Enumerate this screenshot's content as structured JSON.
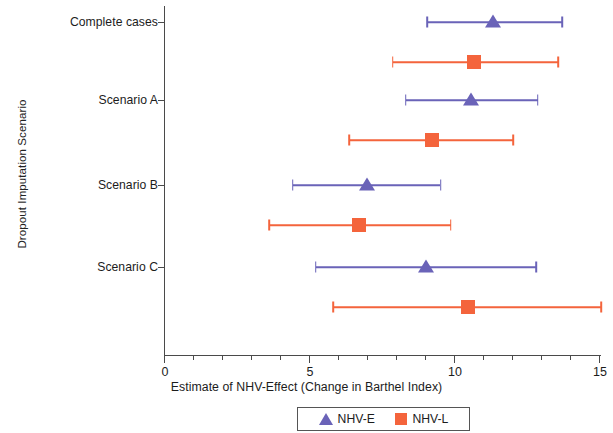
{
  "chart_data": {
    "type": "scatter",
    "title": "",
    "xlabel": "Estimate of NHV-Effect (Change in Barthel Index)",
    "ylabel": "Dropout Imputation Scenario",
    "xlim": [
      0,
      15
    ],
    "xticks": [
      0,
      5,
      10,
      15
    ],
    "xtick_labels": [
      "0",
      "5",
      "10",
      "15"
    ],
    "minor_xticks": [
      1,
      2,
      3,
      4,
      6,
      7,
      8,
      9,
      11,
      12,
      13,
      14
    ],
    "grid": false,
    "legend_position": "bottom",
    "categories": [
      "Complete cases",
      "Scenario A",
      "Scenario B",
      "Scenario C"
    ],
    "series": [
      {
        "name": "NHV-E",
        "color": "#6A63B8",
        "marker": "triangle",
        "values": [
          11.3,
          10.55,
          6.95,
          9.0
        ],
        "ci_low": [
          9.05,
          8.3,
          4.4,
          5.2
        ],
        "ci_high": [
          13.7,
          12.85,
          9.5,
          12.8
        ]
      },
      {
        "name": "NHV-L",
        "color": "#F4643C",
        "marker": "square",
        "values": [
          10.65,
          9.2,
          6.7,
          10.45
        ],
        "ci_low": [
          7.85,
          6.35,
          3.6,
          5.8
        ],
        "ci_high": [
          13.55,
          12.0,
          9.85,
          15.05
        ]
      }
    ]
  },
  "axis": {
    "y_title": "Dropout Imputation Scenario",
    "x_title": "Estimate of NHV-Effect (Change in Barthel Index)",
    "y_tick_labels": [
      "Complete cases",
      "Scenario A",
      "Scenario B",
      "Scenario C"
    ],
    "x_tick_labels": [
      "0",
      "5",
      "10",
      "15"
    ]
  },
  "legend": {
    "items": [
      {
        "label": "NHV-E",
        "color": "#6A63B8",
        "marker": "triangle"
      },
      {
        "label": "NHV-L",
        "color": "#F4643C",
        "marker": "square"
      }
    ]
  }
}
